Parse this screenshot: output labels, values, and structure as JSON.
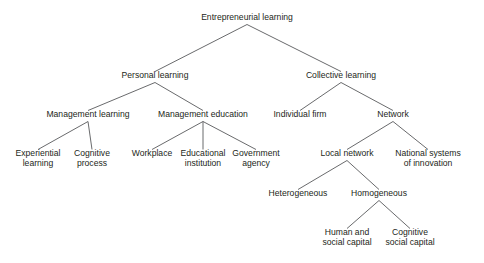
{
  "diagram": {
    "type": "tree-hierarchy",
    "background_color": "#ffffff",
    "text_color": "#231f20",
    "line_color": "#58595b",
    "nodes": [
      {
        "id": "entrepreneurial-learning",
        "label": "Entrepreneurial learning",
        "lines": [
          "Entrepreneurial learning"
        ],
        "level": 0,
        "x": 247,
        "y": 20,
        "parent": null
      },
      {
        "id": "personal-learning",
        "label": "Personal learning",
        "lines": [
          "Personal learning"
        ],
        "level": 1,
        "x": 155,
        "y": 78,
        "parent": "entrepreneurial-learning"
      },
      {
        "id": "collective-learning",
        "label": "Collective learning",
        "lines": [
          "Collective learning"
        ],
        "level": 1,
        "x": 341,
        "y": 78,
        "parent": "entrepreneurial-learning"
      },
      {
        "id": "management-learning",
        "label": "Management learning",
        "lines": [
          "Management learning"
        ],
        "level": 2,
        "x": 88,
        "y": 117,
        "parent": "personal-learning"
      },
      {
        "id": "management-education",
        "label": "Management education",
        "lines": [
          "Management education"
        ],
        "level": 2,
        "x": 203,
        "y": 117,
        "parent": "personal-learning"
      },
      {
        "id": "individual-firm",
        "label": "Individual firm",
        "lines": [
          "Individual firm"
        ],
        "level": 2,
        "x": 300,
        "y": 117,
        "parent": "collective-learning"
      },
      {
        "id": "network",
        "label": "Network",
        "lines": [
          "Network"
        ],
        "level": 2,
        "x": 393,
        "y": 117,
        "parent": "collective-learning"
      },
      {
        "id": "experiential-learning",
        "label": "Experiential learning",
        "lines": [
          "Experiential",
          "learning"
        ],
        "level": 3,
        "x": 38,
        "y": 156,
        "parent": "management-learning"
      },
      {
        "id": "cognitive-process",
        "label": "Cognitive process",
        "lines": [
          "Cognitive",
          "process"
        ],
        "level": 3,
        "x": 92,
        "y": 156,
        "parent": "management-learning"
      },
      {
        "id": "workplace",
        "label": "Workplace",
        "lines": [
          "Workplace"
        ],
        "level": 3,
        "x": 152,
        "y": 156,
        "parent": "management-education"
      },
      {
        "id": "educational-institution",
        "label": "Educational institution",
        "lines": [
          "Educational",
          "institution"
        ],
        "level": 3,
        "x": 203,
        "y": 156,
        "parent": "management-education"
      },
      {
        "id": "government-agency",
        "label": "Government agency",
        "lines": [
          "Government",
          "agency"
        ],
        "level": 3,
        "x": 256,
        "y": 156,
        "parent": "management-education"
      },
      {
        "id": "local-network",
        "label": "Local network",
        "lines": [
          "Local network"
        ],
        "level": 3,
        "x": 347,
        "y": 156,
        "parent": "network"
      },
      {
        "id": "national-systems-of-innovation",
        "label": "National systems of innovation",
        "lines": [
          "National systems",
          "of innovation"
        ],
        "level": 3,
        "x": 428,
        "y": 156,
        "parent": "network"
      },
      {
        "id": "heterogeneous",
        "label": "Heterogeneous",
        "lines": [
          "Heterogeneous"
        ],
        "level": 4,
        "x": 298,
        "y": 196,
        "parent": "local-network"
      },
      {
        "id": "homogeneous",
        "label": "Homogeneous",
        "lines": [
          "Homogeneous"
        ],
        "level": 4,
        "x": 379,
        "y": 196,
        "parent": "local-network"
      },
      {
        "id": "human-and-social-capital",
        "label": "Human and social capital",
        "lines": [
          "Human and",
          "social capital"
        ],
        "level": 5,
        "x": 347,
        "y": 235,
        "parent": "homogeneous"
      },
      {
        "id": "cognitive-social-capital",
        "label": "Cognitive social capital",
        "lines": [
          "Cognitive",
          "social capital"
        ],
        "level": 5,
        "x": 410,
        "y": 235,
        "parent": "homogeneous"
      }
    ]
  }
}
